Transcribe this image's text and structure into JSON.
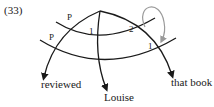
{
  "example_number": "(33)",
  "labels": {
    "upper_left_p": "P",
    "lower_left_p": "P",
    "upper_middle": "1",
    "upper_right": "2",
    "lower_right": "1"
  },
  "leaves": {
    "left": "reviewed",
    "middle": "Louise",
    "right": "that book"
  },
  "colors": {
    "line": "#1a1a1a",
    "loop_arrow": "#9a9a9a"
  }
}
